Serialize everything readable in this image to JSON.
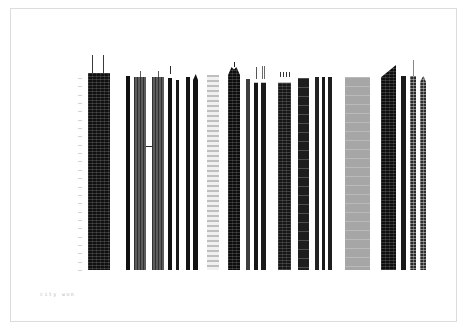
{
  "poster": {
    "title": "city won",
    "caption": "city won",
    "caption_color": "#b9b9b9",
    "background_color": "#ffffff",
    "frame_color": "#dcdcdc",
    "canvas": {
      "width": 468,
      "height": 332
    },
    "baseline_y": 270,
    "frame": {
      "x": 10,
      "y": 8,
      "width": 447,
      "height": 314
    }
  },
  "scale": {
    "name": "height-scale-ruler",
    "x": 78,
    "top": 78,
    "bottom": 270,
    "tick_color": "#d2d2d2",
    "tick_count": 24
  },
  "chart_data": {
    "type": "bar",
    "title": "city won",
    "xlabel": "",
    "ylabel": "height",
    "grid": false,
    "legend": "none",
    "ylim": [
      0,
      218
    ],
    "note": "Skyscraper elevation silhouettes rendered as a barcode-like bar chart; values are drawn heights in pixels above the shared baseline.",
    "categories": [
      "tower-01",
      "tower-02",
      "tower-03",
      "tower-04",
      "tower-05",
      "tower-06",
      "tower-07",
      "tower-08",
      "tower-09",
      "tower-10",
      "tower-11",
      "tower-12",
      "tower-13",
      "tower-14",
      "tower-15",
      "tower-16",
      "tower-17",
      "tower-18",
      "tower-19",
      "tower-20",
      "tower-21",
      "tower-22",
      "tower-23",
      "tower-24",
      "tower-25",
      "tower-26",
      "tower-27",
      "tower-28"
    ],
    "values": [
      202,
      196,
      198,
      198,
      198,
      198,
      196,
      190,
      196,
      200,
      200,
      202,
      210,
      198,
      198,
      198,
      200,
      196,
      198,
      198,
      198,
      198,
      198,
      190,
      212,
      200,
      208,
      200
    ]
  },
  "buildings": [
    {
      "name": "willis-tower",
      "x": 88,
      "w": 22,
      "h": 197,
      "fill": "#101010",
      "texture": "grid",
      "top": "flat",
      "masts": [
        {
          "dx": 4,
          "h": 18,
          "w": 1,
          "color": "#3a3a3a"
        },
        {
          "dx": 15,
          "h": 18,
          "w": 1,
          "color": "#3a3a3a"
        }
      ],
      "cap": {
        "h": 8,
        "fill": "#1c1c1c"
      }
    },
    {
      "name": "slim-tower-a",
      "x": 126,
      "w": 4,
      "h": 194,
      "fill": "#101010",
      "texture": "none",
      "top": "flat"
    },
    {
      "name": "petronas-tower-1",
      "x": 134,
      "w": 12,
      "h": 193,
      "fill": "#4a4a4a",
      "texture": "vert",
      "top": "flat",
      "masts": [
        {
          "dx": 6,
          "h": 6,
          "w": 1,
          "color": "#5a5a5a"
        }
      ]
    },
    {
      "name": "petronas-tower-2",
      "x": 152,
      "w": 12,
      "h": 193,
      "fill": "#4a4a4a",
      "texture": "vert",
      "top": "flat",
      "masts": [
        {
          "dx": 6,
          "h": 6,
          "w": 1,
          "color": "#5a5a5a"
        }
      ]
    },
    {
      "name": "sky-bridge",
      "x": 146,
      "w": 6,
      "h": 1,
      "fill": "#2a2a2a",
      "texture": "none",
      "top": "flat",
      "offset_bottom": 123
    },
    {
      "name": "slim-tower-b",
      "x": 168,
      "w": 4,
      "h": 196,
      "fill": "#121212",
      "texture": "none",
      "top": "spire",
      "masts": [
        {
          "dx": 2,
          "h": 8,
          "w": 1,
          "color": "#2e2e2e"
        }
      ]
    },
    {
      "name": "slim-tower-c",
      "x": 176,
      "w": 3,
      "h": 190,
      "fill": "#1a1a1a",
      "texture": "none",
      "top": "flat"
    },
    {
      "name": "slab-tower-a",
      "x": 186,
      "w": 4,
      "h": 193,
      "fill": "#141414",
      "texture": "none",
      "top": "flat"
    },
    {
      "name": "slab-tower-b",
      "x": 193,
      "w": 5,
      "h": 196,
      "fill": "#121212",
      "texture": "none",
      "top": "bevel"
    },
    {
      "name": "pale-striped-tower",
      "x": 207,
      "w": 12,
      "h": 195,
      "fill": "#f0f0f0",
      "texture": "stripe",
      "top": "flat"
    },
    {
      "name": "pointed-tower",
      "x": 228,
      "w": 12,
      "h": 203,
      "fill": "#0d0d0d",
      "texture": "grid",
      "top": "peak",
      "masts": [
        {
          "dx": 6,
          "h": 5,
          "w": 1,
          "color": "#222222"
        }
      ]
    },
    {
      "name": "slim-tower-d",
      "x": 246,
      "w": 4,
      "h": 191,
      "fill": "#3e3e3e",
      "texture": "none",
      "top": "flat"
    },
    {
      "name": "slim-tower-e",
      "x": 254,
      "w": 4,
      "h": 191,
      "fill": "#161616",
      "texture": "none",
      "top": "spire",
      "masts": [
        {
          "dx": 2,
          "h": 12,
          "w": 1,
          "color": "#555555"
        }
      ]
    },
    {
      "name": "twin-spire-tower",
      "x": 261,
      "w": 5,
      "h": 191,
      "fill": "#1a1a1a",
      "texture": "none",
      "top": "spire",
      "masts": [
        {
          "dx": 1,
          "h": 13,
          "w": 1,
          "color": "#6a6a6a"
        },
        {
          "dx": 3,
          "h": 13,
          "w": 1,
          "color": "#6a6a6a"
        }
      ]
    },
    {
      "name": "crowned-tower",
      "x": 278,
      "w": 13,
      "h": 193,
      "fill": "#161616",
      "texture": "grid",
      "top": "crown",
      "masts": [
        {
          "dx": 2,
          "h": 5,
          "w": 1,
          "color": "#333333"
        },
        {
          "dx": 5,
          "h": 5,
          "w": 1,
          "color": "#333333"
        },
        {
          "dx": 8,
          "h": 5,
          "w": 1,
          "color": "#333333"
        },
        {
          "dx": 11,
          "h": 5,
          "w": 1,
          "color": "#333333"
        }
      ]
    },
    {
      "name": "banded-tower",
      "x": 298,
      "w": 11,
      "h": 192,
      "fill": "#1d1d1d",
      "texture": "band",
      "top": "flat"
    },
    {
      "name": "slim-tower-f",
      "x": 315,
      "w": 4,
      "h": 193,
      "fill": "#222222",
      "texture": "none",
      "top": "flat"
    },
    {
      "name": "slim-tower-g",
      "x": 322,
      "w": 3,
      "h": 193,
      "fill": "#181818",
      "texture": "none",
      "top": "flat"
    },
    {
      "name": "slim-tower-h",
      "x": 328,
      "w": 4,
      "h": 193,
      "fill": "#1e1e1e",
      "texture": "none",
      "top": "flat"
    },
    {
      "name": "grey-slab-tower",
      "x": 345,
      "w": 25,
      "h": 193,
      "fill": "#a6a6a6",
      "texture": "band",
      "top": "flat"
    },
    {
      "name": "slanted-top-tower",
      "x": 381,
      "w": 15,
      "h": 205,
      "fill": "#0f0f0f",
      "texture": "grid",
      "top": "slant"
    },
    {
      "name": "slim-tower-i",
      "x": 401,
      "w": 5,
      "h": 194,
      "fill": "#1a1a1a",
      "texture": "none",
      "top": "flat"
    },
    {
      "name": "antenna-tower",
      "x": 410,
      "w": 6,
      "h": 194,
      "fill": "#2a2a2a",
      "texture": "check",
      "top": "flat",
      "masts": [
        {
          "dx": 3,
          "h": 16,
          "w": 1,
          "color": "#888888"
        }
      ]
    },
    {
      "name": "bevel-tower",
      "x": 420,
      "w": 6,
      "h": 194,
      "fill": "#2e2e2e",
      "texture": "check",
      "top": "bevel"
    }
  ]
}
